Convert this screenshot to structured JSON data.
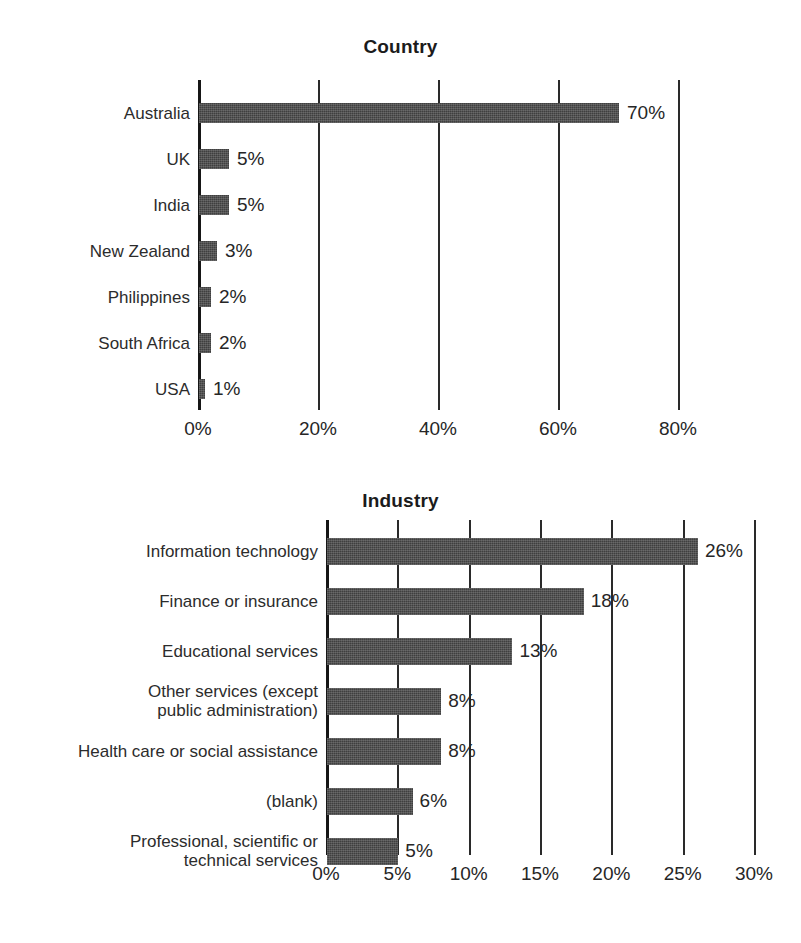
{
  "page": {
    "background": "#ffffff",
    "bar_color": "#3f3f3f",
    "axis_color": "#161616",
    "text_color": "#2b2b2b"
  },
  "charts": [
    {
      "id": "country-chart",
      "title": "Country"
    },
    {
      "id": "industry-chart",
      "title": "Industry"
    }
  ],
  "chart_data": [
    {
      "type": "bar",
      "orientation": "horizontal",
      "title": "Country",
      "xlabel": "",
      "ylabel": "",
      "xlim": [
        0,
        80
      ],
      "xticks": [
        0,
        20,
        40,
        60,
        80
      ],
      "xtick_labels": [
        "0%",
        "20%",
        "40%",
        "60%",
        "80%"
      ],
      "grid": true,
      "legend": "none",
      "categories": [
        "Australia",
        "UK",
        "India",
        "New Zealand",
        "Philippines",
        "South Africa",
        "USA"
      ],
      "values": [
        70,
        5,
        5,
        3,
        2,
        2,
        1
      ],
      "data_labels": [
        "70%",
        "5%",
        "5%",
        "3%",
        "2%",
        "2%",
        "1%"
      ]
    },
    {
      "type": "bar",
      "orientation": "horizontal",
      "title": "Industry",
      "xlabel": "",
      "ylabel": "",
      "xlim": [
        0,
        30
      ],
      "xticks": [
        0,
        5,
        10,
        15,
        20,
        25,
        30
      ],
      "xtick_labels": [
        "0%",
        "5%",
        "10%",
        "15%",
        "20%",
        "25%",
        "30%"
      ],
      "grid": true,
      "legend": "none",
      "categories": [
        "Information technology",
        "Finance or insurance",
        "Educational services",
        "Other services (except\npublic administration)",
        "Health care or social assistance",
        "(blank)",
        "Professional, scientific or\ntechnical services"
      ],
      "values": [
        26,
        18,
        13,
        8,
        8,
        6,
        5
      ],
      "data_labels": [
        "26%",
        "18%",
        "13%",
        "8%",
        "8%",
        "6%",
        "5%"
      ]
    }
  ]
}
